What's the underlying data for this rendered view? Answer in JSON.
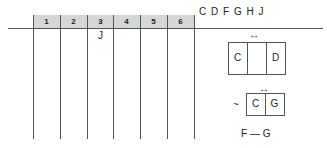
{
  "grid": {
    "column_headers": [
      "1",
      "2",
      "3",
      "4",
      "5",
      "6"
    ],
    "entries": [
      {
        "column": 3,
        "row": 1,
        "value": "J"
      }
    ]
  },
  "letters": "C D F G H J",
  "rule1": {
    "arrow": "↔",
    "left": "C",
    "middle": "",
    "right": "D"
  },
  "rule2": {
    "arrow": "↔",
    "prefix": "~",
    "left": "C",
    "right": "G"
  },
  "rule3": {
    "text": "F — G"
  }
}
